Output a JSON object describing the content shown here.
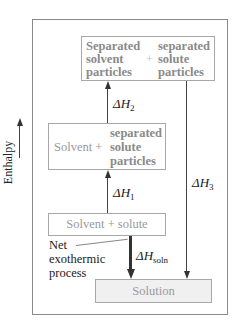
{
  "diagram": {
    "type": "enthalpy-level-diagram",
    "axis": {
      "label": "Enthalpy",
      "direction": "up"
    },
    "levels": [
      {
        "id": "separated",
        "left_lines": [
          "Separated",
          "solvent",
          "particles"
        ],
        "operator": "+",
        "right_lines": [
          "separated",
          "solute",
          "particles"
        ]
      },
      {
        "id": "intermediate",
        "left_text": "Solvent +",
        "right_lines": [
          "separated",
          "solute",
          "particles"
        ]
      },
      {
        "id": "initial",
        "text": "Solvent + solute"
      },
      {
        "id": "final",
        "text": "Solution"
      }
    ],
    "transitions": [
      {
        "label": "ΔH",
        "subscript": "1",
        "from": "initial",
        "to": "intermediate",
        "direction": "up"
      },
      {
        "label": "ΔH",
        "subscript": "2",
        "from": "intermediate",
        "to": "separated",
        "direction": "up"
      },
      {
        "label": "ΔH",
        "subscript": "3",
        "from": "separated",
        "to": "final",
        "direction": "down"
      },
      {
        "label": "ΔH",
        "subscript": "soln",
        "from": "initial",
        "to": "final",
        "direction": "down",
        "emphasis": "thick"
      }
    ],
    "annotation": {
      "lines": [
        "Net",
        "exothermic",
        "process"
      ]
    },
    "colors": {
      "frame": "#8a8a8a",
      "box_border": "#a8a8a8",
      "box_text": "#9a9a9a",
      "arrow": "#333333",
      "solution_fill": "#f0f0f0"
    }
  }
}
